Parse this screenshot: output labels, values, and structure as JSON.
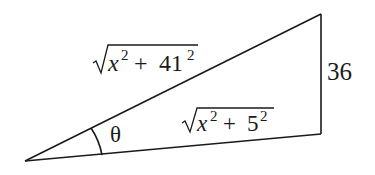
{
  "diagram": {
    "type": "right-triangle-like figure",
    "stroke_color": "#1a1a1a",
    "background": "#ffffff",
    "vertices": {
      "left": [
        25,
        161
      ],
      "top_right": [
        321,
        14
      ],
      "bottom_right": [
        321,
        134
      ]
    },
    "labels": {
      "hypotenuse_top": {
        "radical": "√",
        "var": "x",
        "exp1": "2",
        "op": " + ",
        "num": "41",
        "exp2": "2"
      },
      "side_bottom": {
        "radical": "√",
        "var": "x",
        "exp1": "2",
        "op": " + ",
        "num": "5",
        "exp2": "2"
      },
      "side_right": "36",
      "angle": "θ"
    }
  }
}
